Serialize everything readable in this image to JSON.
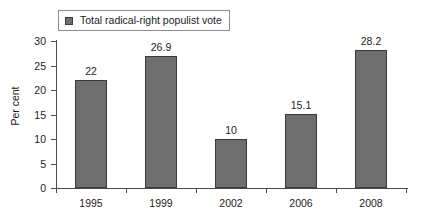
{
  "legend": {
    "swatch_name": "legend-color-swatch",
    "label": "Total radical-right populist vote",
    "color": "#6e6e6e"
  },
  "axes": {
    "y_title": "Per cent",
    "y_ticks": [
      "0",
      "5",
      "10",
      "15",
      "20",
      "25",
      "30"
    ]
  },
  "chart_data": {
    "type": "bar",
    "title": "",
    "subtitle": "",
    "xlabel": "",
    "ylabel": "Per cent",
    "categories": [
      "1995",
      "1999",
      "2002",
      "2006",
      "2008"
    ],
    "values": [
      22,
      26.9,
      10,
      15.1,
      28.2
    ],
    "value_labels": [
      "22",
      "26.9",
      "10",
      "15.1",
      "28.2"
    ],
    "series": [
      {
        "name": "Total radical-right populist vote",
        "color": "#6e6e6e",
        "values": [
          22,
          26.9,
          10,
          15.1,
          28.2
        ]
      }
    ],
    "ylim": [
      0,
      30
    ],
    "ytick_step": 5,
    "grid": false,
    "legend_position": "top-left"
  }
}
